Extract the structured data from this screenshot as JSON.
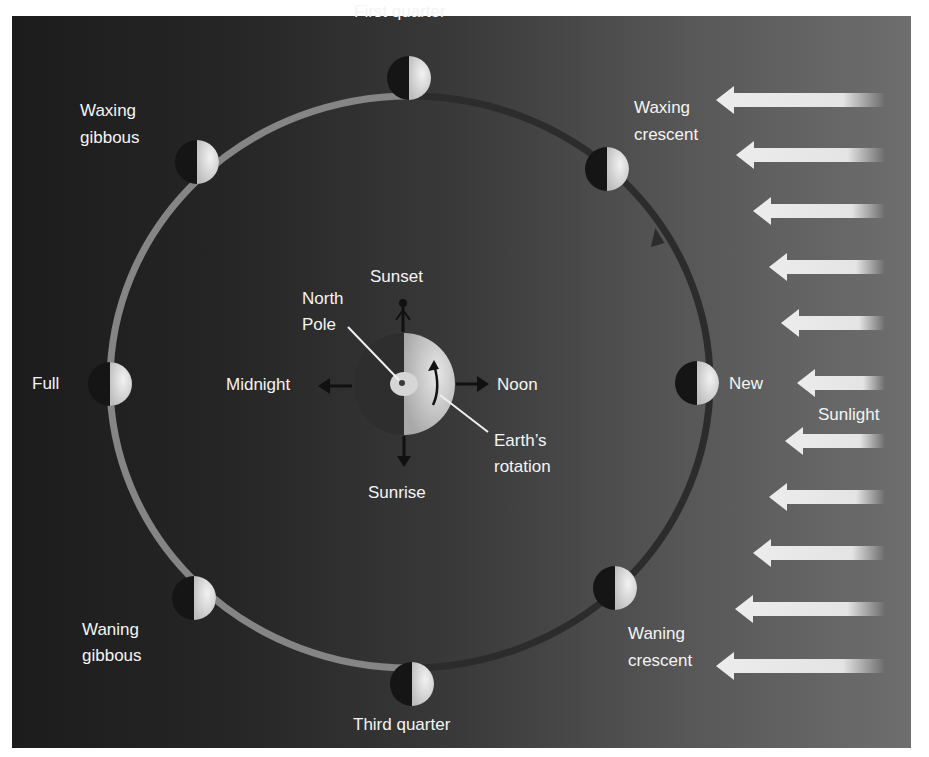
{
  "diagram": {
    "phases": [
      {
        "id": "new",
        "label": "New",
        "angle_deg": 0
      },
      {
        "id": "waxing-crescent",
        "label_line1": "Waxing",
        "label_line2": "crescent",
        "angle_deg": 45
      },
      {
        "id": "first-quarter",
        "label": "First quarter",
        "angle_deg": 90
      },
      {
        "id": "waxing-gibbous",
        "label_line1": "Waxing",
        "label_line2": "gibbous",
        "angle_deg": 135
      },
      {
        "id": "full",
        "label": "Full",
        "angle_deg": 180
      },
      {
        "id": "waning-gibbous",
        "label_line1": "Waning",
        "label_line2": "gibbous",
        "angle_deg": 225
      },
      {
        "id": "third-quarter",
        "label": "Third quarter",
        "angle_deg": 270
      },
      {
        "id": "waning-crescent",
        "label_line1": "Waning",
        "label_line2": "crescent",
        "angle_deg": 315
      }
    ],
    "earth": {
      "times": {
        "sunset": "Sunset",
        "noon": "Noon",
        "sunrise": "Sunrise",
        "midnight": "Midnight"
      },
      "north_pole_line1": "North",
      "north_pole_line2": "Pole",
      "rotation_line1": "Earth’s",
      "rotation_line2": "rotation"
    },
    "sunlight": {
      "label": "Sunlight",
      "arrow_count": 11,
      "direction": "right-to-left"
    },
    "colors": {
      "orbit_lit": "#8a8a8a",
      "orbit_dark": "#2a2a2a",
      "label": "#f4f4f4",
      "sun_arrow": "#e8e8e8"
    }
  }
}
